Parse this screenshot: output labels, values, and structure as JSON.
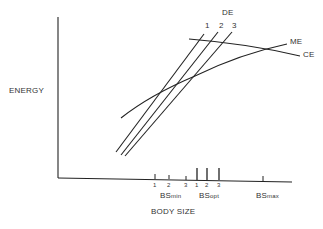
{
  "diagram": {
    "y_axis_label": "ENERGY",
    "x_axis_label": "BODY SIZE",
    "curves": [
      {
        "id": "DE1",
        "label": "1",
        "group": "DE"
      },
      {
        "id": "DE2",
        "label": "2",
        "group": "DE"
      },
      {
        "id": "DE3",
        "label": "3",
        "group": "DE"
      },
      {
        "id": "ME",
        "label": "ME"
      },
      {
        "id": "CE",
        "label": "CE"
      }
    ],
    "de_group_label": "DE",
    "de_labels": [
      "1",
      "2",
      "3"
    ],
    "me_label": "ME",
    "ce_label": "CE",
    "x_ticks": {
      "bs_min": {
        "base": "BS",
        "sub": "min",
        "ticks": [
          "1",
          "2",
          "3"
        ]
      },
      "bs_opt": {
        "base": "BS",
        "sub": "opt",
        "ticks": [
          "1",
          "2",
          "3"
        ]
      },
      "bs_max": {
        "base": "BS",
        "sub": "max"
      }
    }
  }
}
